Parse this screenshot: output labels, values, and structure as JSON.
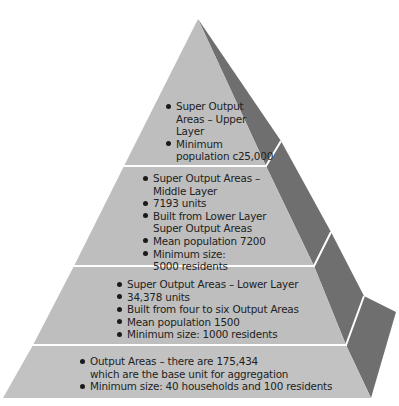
{
  "diagram": {
    "type": "pyramid",
    "colors": {
      "front_face": "#bebebe",
      "side_face": "#6f6f6f",
      "divider": "#ffffff",
      "text": "#222222"
    },
    "levels": [
      {
        "name": "Super Output Areas - Upper Layer",
        "bullets": [
          [
            "Super Output",
            "Areas – Upper",
            "Layer"
          ],
          [
            "Minimum",
            "population c25,000"
          ]
        ]
      },
      {
        "name": "Super Output Areas - Middle Layer",
        "bullets": [
          [
            "Super Output Areas –",
            "Middle Layer"
          ],
          [
            "7193 units"
          ],
          [
            "Built from Lower Layer",
            "Super Output Areas"
          ],
          [
            "Mean population 7200"
          ],
          [
            "Minimum size:",
            "5000 residents"
          ]
        ]
      },
      {
        "name": "Super Output Areas - Lower Layer",
        "bullets": [
          [
            "Super Output Areas – Lower Layer"
          ],
          [
            "34,378 units"
          ],
          [
            "Built from four to six Output Areas"
          ],
          [
            "Mean population 1500"
          ],
          [
            "Minimum size: 1000 residents"
          ]
        ]
      },
      {
        "name": "Output Areas",
        "bullets": [
          [
            "Output Areas – there are 175,434",
            "which are the base unit for aggregation"
          ],
          [
            "Minimum size: 40 households and 100 residents"
          ]
        ]
      }
    ]
  }
}
